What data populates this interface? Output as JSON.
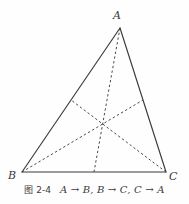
{
  "figure": {
    "background_color": "#fefefe",
    "stroke_color": "#3a3a3a",
    "dash_color": "#4a4a4a",
    "triangle": {
      "vertices": [
        {
          "name": "A",
          "label": "A",
          "x": 120,
          "y": 28
        },
        {
          "name": "B",
          "label": "B",
          "x": 22,
          "y": 172
        },
        {
          "name": "C",
          "label": "C",
          "x": 166,
          "y": 172
        }
      ],
      "sides": [
        {
          "name": "side-AB",
          "from": "A",
          "to": "B",
          "style": "solid"
        },
        {
          "name": "side-BC",
          "from": "B",
          "to": "C",
          "style": "solid"
        },
        {
          "name": "side-CA",
          "from": "C",
          "to": "A",
          "style": "solid"
        }
      ]
    },
    "centroid": {
      "name": "centroid",
      "x": 97,
      "y": 113
    },
    "medians": [
      {
        "name": "median-from-A",
        "from": "A",
        "to_midpoint_of": "BC",
        "mx": 94,
        "my": 172,
        "style": "dashed"
      },
      {
        "name": "median-from-B",
        "from": "B",
        "to_midpoint_of": "CA",
        "mx": 143,
        "my": 100,
        "style": "dashed"
      },
      {
        "name": "median-from-C",
        "from": "C",
        "to_midpoint_of": "AB",
        "mx": 71,
        "my": 100,
        "style": "dashed"
      }
    ],
    "labels": {
      "A": "A",
      "B": "B",
      "C": "C"
    }
  },
  "caption": {
    "figure_number": "图 2-4",
    "mapping_text": "A → B, B → C, C → A",
    "full_text": "图 2-4    A → B, B → C, C → A"
  }
}
